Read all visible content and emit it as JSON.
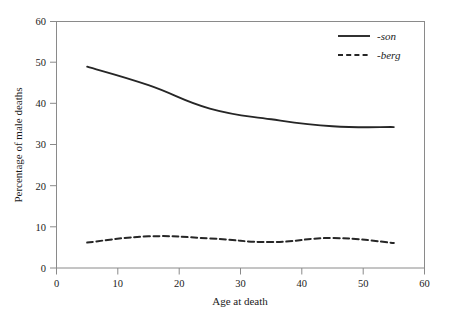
{
  "chart_data": {
    "type": "line",
    "title": "",
    "xlabel": "Age at death",
    "ylabel": "Percentage of male deaths",
    "x": [
      5,
      15,
      25,
      35,
      45,
      55
    ],
    "xlim": [
      0,
      60
    ],
    "ylim": [
      0,
      60
    ],
    "xticks": [
      0,
      10,
      20,
      30,
      40,
      50,
      60
    ],
    "yticks": [
      0,
      10,
      20,
      30,
      40,
      50,
      60
    ],
    "grid": false,
    "legend_position": "top-right",
    "series": [
      {
        "name": "-son",
        "style": "solid",
        "color": "#262626",
        "values": [
          49.0,
          44.5,
          38.8,
          36.2,
          34.5,
          34.3
        ]
      },
      {
        "name": "-berg",
        "style": "dashed",
        "color": "#262626",
        "values": [
          6.2,
          7.7,
          7.2,
          6.3,
          7.3,
          6.1
        ]
      }
    ]
  },
  "axes": {
    "x_tick_labels": [
      "0",
      "10",
      "20",
      "30",
      "40",
      "50",
      "60"
    ],
    "y_tick_labels": [
      "0",
      "10",
      "20",
      "30",
      "40",
      "50",
      "60"
    ],
    "x_axis_title": "Age at death",
    "y_axis_title": "Percentage of male deaths"
  },
  "legend": {
    "entries": [
      {
        "label": "-son",
        "style": "solid"
      },
      {
        "label": "-berg",
        "style": "dashed"
      }
    ]
  }
}
